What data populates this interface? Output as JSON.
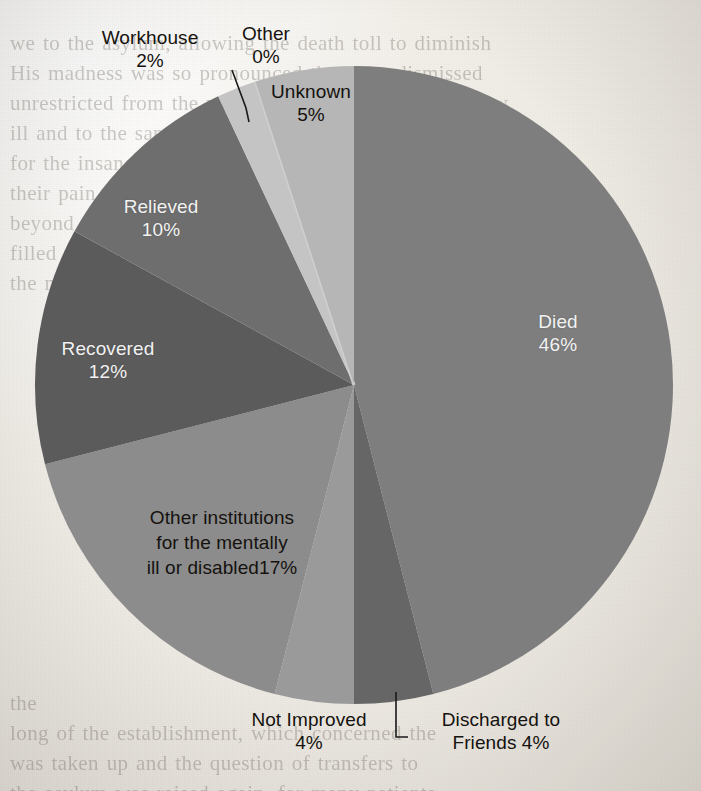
{
  "page": {
    "background_bleed_text": "we to the asylum, allowing the death toll to diminish\nHis madness was so pronounced that they dismissed\nunrestricted from the workhouse, with no certificate, w\nill and to the sanatorium, was there no proper institu\nfor the insane, and where every effort was made to al\ntheir pain, and the directors sought better means\nbeyond the gates of the asylum, in rooms which often\nfilled with the cries of patients, the medical officer re\nthe matter to the board of guardians for further\n\n\n\n\n\n\n\n\n\n\n\n\n\nthe\nlong of the establishment, which concerned the\nwas taken up and the question of transfers to\nthe asylum was raised again, for many patients\nsimply remained in the workhouse until they died\nand Asylum Reports, the numbers described in the\nt. Certain of the officers at the asylum, in Welling-\nand Berkshire County Asylum, noted that they used\nrecord, though it was not always possible to make it so\nthat they came to the core of the matter, for making it so\nwas a question for the coroner, a death of an inmate who"
  },
  "chart_data": {
    "type": "pie",
    "title": "",
    "labels_inside": true,
    "legend": "none",
    "total_percent": 100,
    "categories": [
      "Died",
      "Discharged to Friends",
      "Not Improved",
      "Other institutions for the mentally ill or disabled",
      "Recovered",
      "Relieved",
      "Workhouse",
      "Other",
      "Unknown"
    ],
    "values": [
      46,
      4,
      4,
      17,
      12,
      10,
      2,
      0,
      5
    ],
    "colors": [
      "#7e7e7e",
      "#666666",
      "#9a9a9a",
      "#8c8c8c",
      "#5b5b5b",
      "#6e6e6e",
      "#c4c4c4",
      "#d0d0d0",
      "#b6b6b6"
    ],
    "start_angle_deg": 0,
    "direction": "clockwise",
    "slices": [
      {
        "name": "died",
        "label": "Died",
        "percent_text": "46%",
        "value": 46,
        "color": "#7e7e7e",
        "label_color": "white",
        "has_leader_line": false
      },
      {
        "name": "discharged-to-friends",
        "label": "Discharged to",
        "label_line2": "Friends 4%",
        "percent_text": "4%",
        "value": 4,
        "color": "#666666",
        "label_color": "dark",
        "has_leader_line": true
      },
      {
        "name": "not-improved",
        "label": "Not Improved",
        "percent_text": "4%",
        "value": 4,
        "color": "#9a9a9a",
        "label_color": "dark",
        "has_leader_line": false
      },
      {
        "name": "other-institutions",
        "label": "Other institutions\nfor the mentally\nill or disabled17%",
        "percent_text": "17%",
        "value": 17,
        "color": "#8c8c8c",
        "label_color": "dark",
        "has_leader_line": false
      },
      {
        "name": "recovered",
        "label": "Recovered",
        "percent_text": "12%",
        "value": 12,
        "color": "#5b5b5b",
        "label_color": "white",
        "has_leader_line": false
      },
      {
        "name": "relieved",
        "label": "Relieved",
        "percent_text": "10%",
        "value": 10,
        "color": "#6e6e6e",
        "label_color": "white",
        "has_leader_line": false
      },
      {
        "name": "workhouse",
        "label": "Workhouse",
        "percent_text": "2%",
        "value": 2,
        "color": "#c4c4c4",
        "label_color": "dark",
        "has_leader_line": true
      },
      {
        "name": "other",
        "label": "Other",
        "percent_text": "0%",
        "value": 0,
        "color": "#d0d0d0",
        "label_color": "dark",
        "has_leader_line": false
      },
      {
        "name": "unknown",
        "label": "Unknown",
        "percent_text": "5%",
        "value": 5,
        "color": "#b6b6b6",
        "label_color": "dark",
        "has_leader_line": false
      }
    ],
    "geometry": {
      "center_x": 354,
      "center_y": 385,
      "radius": 319
    }
  }
}
